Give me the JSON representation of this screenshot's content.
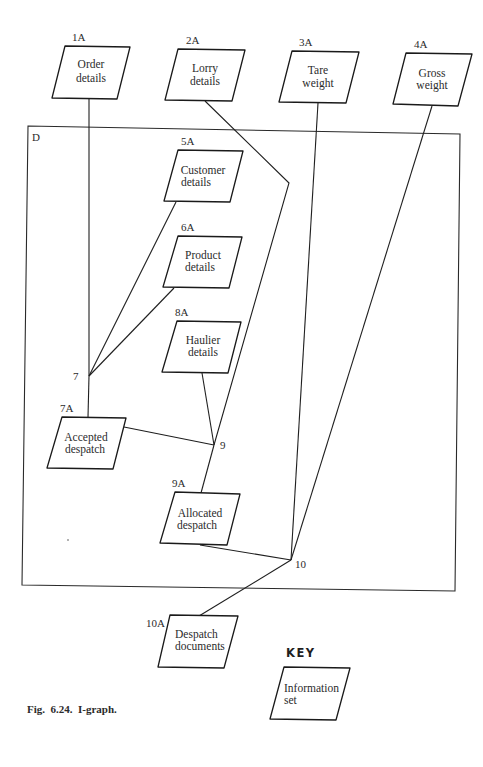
{
  "figure": {
    "caption": "Fig.  6.24.  I-graph.",
    "boundary_label": "D",
    "key": {
      "title": "KEY",
      "sample": {
        "line1": "Information",
        "line2": "set"
      }
    }
  },
  "information_sets": [
    {
      "id": "1A",
      "line1": "Order",
      "line2": "details"
    },
    {
      "id": "2A",
      "line1": "Lorry",
      "line2": "details"
    },
    {
      "id": "3A",
      "line1": "Tare",
      "line2": "weight"
    },
    {
      "id": "4A",
      "line1": "Gross",
      "line2": "weight"
    },
    {
      "id": "5A",
      "line1": "Customer",
      "line2": "details"
    },
    {
      "id": "6A",
      "line1": "Product",
      "line2": "details"
    },
    {
      "id": "8A",
      "line1": "Haulier",
      "line2": "details"
    },
    {
      "id": "7A",
      "line1": "Accepted",
      "line2": "despatch"
    },
    {
      "id": "9A",
      "line1": "Allocated",
      "line2": "despatch"
    },
    {
      "id": "10A",
      "line1": "Despatch",
      "line2": "documents"
    }
  ],
  "junctions": [
    {
      "id": "7"
    },
    {
      "id": "9"
    },
    {
      "id": "10"
    }
  ],
  "edges": [
    {
      "from": "1A",
      "to": "7"
    },
    {
      "from": "5A",
      "to": "7"
    },
    {
      "from": "6A",
      "to": "7"
    },
    {
      "from": "7",
      "to": "7A"
    },
    {
      "from": "2A",
      "to": "9"
    },
    {
      "from": "8A",
      "to": "9"
    },
    {
      "from": "7A",
      "to": "9"
    },
    {
      "from": "9",
      "to": "9A"
    },
    {
      "from": "3A",
      "to": "10"
    },
    {
      "from": "4A",
      "to": "10"
    },
    {
      "from": "9A",
      "to": "10"
    },
    {
      "from": "10",
      "to": "10A"
    }
  ]
}
